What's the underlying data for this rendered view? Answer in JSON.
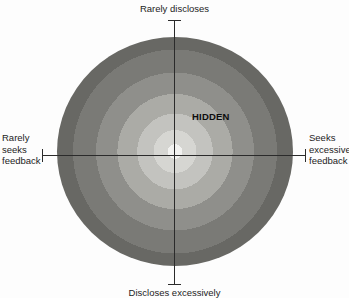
{
  "figure": {
    "type": "johari-style-radial-diagram",
    "background_color": "#fdfdfd",
    "axis_color": "#2b2b2b",
    "region_label": "HIDDEN"
  },
  "axes": {
    "top_label": "Rarely discloses",
    "bottom_label": "Discloses excessively",
    "left_label": "Rarely\nseeks\nfeedback",
    "right_label": "Seeks\nexcessive\nfeedback"
  },
  "chart_data": {
    "type": "pie",
    "title": "",
    "subtitle": "",
    "xlabel": "Feedback seeking (Rarely seeks feedback ↔ Seeks excessive feedback)",
    "ylabel": "Disclosure (Rarely discloses ↔ Discloses excessively)",
    "grid": false,
    "legend_position": "none",
    "annotations": [
      {
        "text": "HIDDEN",
        "x": 0.18,
        "y": 0.22,
        "bold": true
      },
      {
        "text": "Rarely discloses",
        "x": 0.0,
        "y": 1.1
      },
      {
        "text": "Discloses excessively",
        "x": 0.0,
        "y": -1.1
      },
      {
        "text": "Rarely seeks feedback",
        "x": -1.15,
        "y": 0.0
      },
      {
        "text": "Seeks excessive feedback",
        "x": 1.15,
        "y": 0.0
      }
    ],
    "xlim": [
      -1.15,
      1.15
    ],
    "ylim": [
      -1.15,
      1.15
    ],
    "categories": [
      "ring-1-core",
      "ring-2",
      "ring-3",
      "ring-4",
      "ring-5",
      "ring-6",
      "ring-7",
      "ring-8-outer"
    ],
    "values": [
      4.5,
      13,
      23,
      35,
      48,
      62,
      78,
      100
    ],
    "series": [
      {
        "name": "concentric-intensity-rings",
        "values": [
          4.5,
          13,
          23,
          35,
          48,
          62,
          78,
          100
        ],
        "colors": [
          "#f2f2f0",
          "#d6d6d2",
          "#c3c3bf",
          "#ababa6",
          "#8f8f8b",
          "#7a7a76",
          "#686864",
          "#5a5a56"
        ]
      }
    ]
  }
}
